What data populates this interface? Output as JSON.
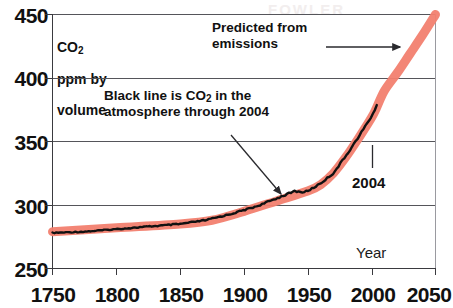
{
  "chart_data": {
    "type": "line",
    "title": "",
    "xlabel": "Year",
    "ylabel": "CO2 ppm by volume",
    "ylabel_line1": "CO",
    "ylabel_sub": "2",
    "ylabel_line2": "ppm by",
    "ylabel_line3": "volume",
    "xlim": [
      1750,
      2050
    ],
    "ylim": [
      250,
      450
    ],
    "xticks": [
      1750,
      1800,
      1850,
      1900,
      1950,
      2000,
      2050
    ],
    "yticks": [
      250,
      300,
      350,
      400,
      450
    ],
    "grid": true,
    "grid_axis": "y",
    "legend_position": "inline-annotations",
    "annotations": [
      {
        "name": "predicted-annotation",
        "text_line1": "Predicted from",
        "text_line2": "emissions",
        "arrow": "horizontal-right",
        "points_to": [
          2040,
          432
        ]
      },
      {
        "name": "observed-annotation",
        "text_line1_pre": "Black line is CO",
        "text_line1_sub": "2",
        "text_line1_post": " in the",
        "text_line2": "atmosphere through 2004",
        "arrow": "diagonal-down-right",
        "points_to": [
          1945,
          311
        ]
      },
      {
        "name": "endpoint-annotation",
        "text": "2004",
        "arrow": "vertical-up",
        "points_to": [
          2004,
          378
        ]
      }
    ],
    "series": [
      {
        "name": "Predicted from emissions",
        "color": "#f2806f",
        "style": "thick-band",
        "x": [
          1750,
          1800,
          1850,
          1875,
          1900,
          1925,
          1950,
          1960,
          1970,
          1980,
          1990,
          2000,
          2004,
          2010,
          2020,
          2030,
          2040,
          2050
        ],
        "values": [
          279,
          282,
          285,
          288,
          295,
          303,
          311,
          316,
          325,
          338,
          353,
          369,
          377,
          390,
          404,
          419,
          434,
          450
        ]
      },
      {
        "name": "Black line is CO2 in the atmosphere through 2004",
        "color": "#111111",
        "style": "jagged-line",
        "x": [
          1750,
          1775,
          1800,
          1825,
          1850,
          1870,
          1890,
          1900,
          1910,
          1920,
          1930,
          1940,
          1945,
          1950,
          1960,
          1970,
          1980,
          1990,
          2000,
          2004
        ],
        "values": [
          278,
          279,
          281,
          283,
          285,
          288,
          293,
          296,
          299,
          303,
          307,
          311,
          310,
          311,
          317,
          325,
          339,
          354,
          370,
          378
        ]
      }
    ]
  },
  "axes": {
    "y_tick_labels": [
      "450",
      "400",
      "350",
      "300",
      "250"
    ],
    "x_tick_labels": [
      "1750",
      "1800",
      "1850",
      "1900",
      "1950",
      "2000",
      "2050"
    ],
    "x_axis_title": "Year"
  },
  "watermark": {
    "text": "FOWLER"
  },
  "colors": {
    "prediction_band": "#f2806f",
    "observed_line": "#111111",
    "gridline": "#55555a",
    "axis": "#3a3a3f",
    "text": "#111111"
  }
}
